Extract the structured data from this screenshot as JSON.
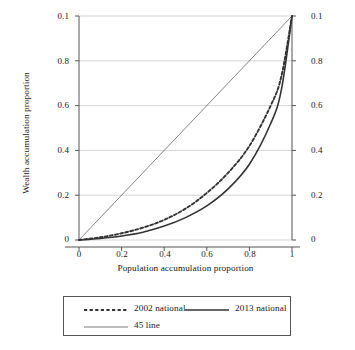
{
  "chart_data": {
    "type": "line",
    "title": "",
    "xlabel": "Population accumulation proportion",
    "ylabel": "Wealth accumulation proportion",
    "xlim": [
      0,
      1
    ],
    "ylim": [
      0,
      1
    ],
    "grid": true,
    "grid_axis": "y",
    "dual_y_axis": true,
    "legend_position": "below-plot",
    "xticks": [
      "0",
      "0.2",
      "0.4",
      "0.6",
      "0.8",
      "1"
    ],
    "xtick_values": [
      0,
      0.2,
      0.4,
      0.6,
      0.8,
      1
    ],
    "yticks": [
      "0",
      "0.2",
      "0.4",
      "0.6",
      "0.8",
      "0.1"
    ],
    "ytick_values": [
      0,
      0.2,
      0.4,
      0.6,
      0.8,
      1
    ],
    "yticks_right": [
      "0",
      "0.2",
      "0.4",
      "0.6",
      "0.8",
      "0.1"
    ],
    "x": [
      0,
      0.1,
      0.2,
      0.3,
      0.4,
      0.5,
      0.6,
      0.7,
      0.8,
      0.9,
      0.95,
      1
    ],
    "series": [
      {
        "name": "2002 national",
        "style": "dashed",
        "color": "#333333",
        "width": 1.9,
        "values": [
          0,
          0.012,
          0.03,
          0.055,
          0.09,
          0.14,
          0.21,
          0.3,
          0.42,
          0.6,
          0.73,
          1.0
        ]
      },
      {
        "name": "2013 national",
        "style": "solid",
        "color": "#333333",
        "width": 1.6,
        "values": [
          0,
          0.007,
          0.018,
          0.035,
          0.062,
          0.1,
          0.152,
          0.228,
          0.338,
          0.52,
          0.67,
          1.0
        ]
      },
      {
        "name": "45 line",
        "style": "solid",
        "color": "#666666",
        "width": 0.8,
        "values": [
          0,
          0.1,
          0.2,
          0.3,
          0.4,
          0.5,
          0.6,
          0.7,
          0.8,
          0.9,
          0.95,
          1.0
        ]
      }
    ]
  },
  "axes": {
    "y_title": "Wealth accumulation proportion",
    "x_title": "Population accumulation proportion",
    "y_left_ticks": [
      "0.1",
      "0.8",
      "0.6",
      "0.4",
      "0.2",
      "0"
    ],
    "y_right_ticks": [
      "0.1",
      "0.8",
      "0.6",
      "0.4",
      "0.2",
      "0"
    ],
    "x_ticks": [
      "0",
      "0.2",
      "0.4",
      "0.6",
      "0.8",
      "1"
    ]
  },
  "legend": {
    "entries": [
      {
        "label": "2002 national",
        "style": "dashed"
      },
      {
        "label": "2013 national",
        "style": "solid-thick"
      },
      {
        "label": "45 line",
        "style": "solid-thin"
      }
    ]
  },
  "colors": {
    "gridline": "#c9c9c9",
    "axis": "#555555",
    "curve": "#333333",
    "diagonal": "#707070",
    "background": "#ffffff"
  }
}
